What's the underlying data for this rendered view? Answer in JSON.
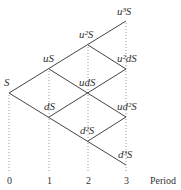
{
  "diagram": {
    "nodes": [
      {
        "id": "S",
        "label": "S",
        "period": 0
      },
      {
        "id": "uS",
        "label": "uS",
        "period": 1
      },
      {
        "id": "dS",
        "label": "dS",
        "period": 1
      },
      {
        "id": "u2S",
        "label": "u²S",
        "period": 2
      },
      {
        "id": "udS",
        "label": "udS",
        "period": 2
      },
      {
        "id": "d2S",
        "label": "d²S",
        "period": 2
      },
      {
        "id": "u3S",
        "label": "u³S",
        "period": 3
      },
      {
        "id": "u2dS",
        "label": "u²dS",
        "period": 3
      },
      {
        "id": "ud2S",
        "label": "ud²S",
        "period": 3
      },
      {
        "id": "d3S",
        "label": "d³S",
        "period": 3
      }
    ],
    "axis": {
      "ticks": [
        "0",
        "1",
        "2",
        "3"
      ],
      "label": "Period"
    }
  }
}
